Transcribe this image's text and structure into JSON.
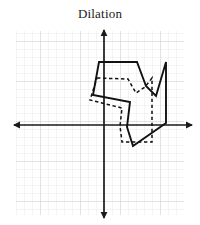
{
  "title": "Dilation",
  "colors": {
    "grid_minor": "#e3e3e8",
    "grid_major": "#cfcfd6",
    "axis": "#1a1a1a",
    "shape_stroke": "#111111",
    "background": "#ffffff"
  },
  "chart_data": {
    "type": "scatter",
    "title": "Dilation",
    "xlabel": "",
    "ylabel": "",
    "grid": true,
    "legend": "none",
    "axes": {
      "origin_px": [
        104,
        125
      ],
      "cell_px": 8,
      "x_range_px": [
        14,
        192
      ],
      "y_range_px": [
        30,
        218
      ],
      "x_arrows": true,
      "y_arrows": true,
      "xlim": [
        -11.25,
        11
      ],
      "ylim": [
        -11.6,
        11.9
      ]
    },
    "series": [
      {
        "name": "image-dilated-preimage",
        "style": "solid",
        "closed": true,
        "points_px": [
          [
            99,
            62
          ],
          [
            137,
            62
          ],
          [
            146,
            86
          ],
          [
            156,
            96
          ],
          [
            166,
            62
          ],
          [
            166,
            123
          ],
          [
            133,
            146
          ],
          [
            127,
            127
          ],
          [
            130,
            102
          ],
          [
            93,
            95
          ]
        ],
        "points_grid": [
          [
            -0.6,
            7.9
          ],
          [
            4.1,
            7.9
          ],
          [
            5.3,
            4.9
          ],
          [
            6.5,
            3.6
          ],
          [
            7.8,
            7.9
          ],
          [
            7.8,
            0.3
          ],
          [
            3.6,
            -2.6
          ],
          [
            2.9,
            -0.3
          ],
          [
            3.3,
            2.9
          ],
          [
            -1.4,
            3.8
          ]
        ]
      },
      {
        "name": "preimage-original",
        "style": "dashed",
        "closed": true,
        "points_px": [
          [
            97,
            78
          ],
          [
            128,
            79
          ],
          [
            136,
            93
          ],
          [
            145,
            87
          ],
          [
            152,
            78
          ],
          [
            152,
            142
          ],
          [
            122,
            142
          ],
          [
            120,
            126
          ],
          [
            122,
            108
          ],
          [
            90,
            100
          ]
        ],
        "points_grid": [
          [
            -0.9,
            5.9
          ],
          [
            3.0,
            5.8
          ],
          [
            4.0,
            4.0
          ],
          [
            5.1,
            4.8
          ],
          [
            6.0,
            5.9
          ],
          [
            6.0,
            -2.1
          ],
          [
            2.3,
            -2.1
          ],
          [
            2.0,
            -0.1
          ],
          [
            2.3,
            2.1
          ],
          [
            -1.8,
            3.1
          ]
        ]
      }
    ]
  }
}
